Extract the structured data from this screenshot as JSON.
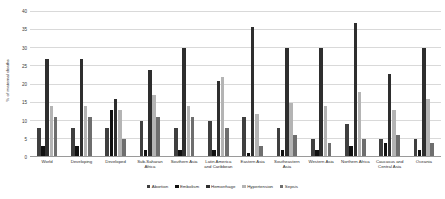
{
  "chart_data": {
    "type": "bar",
    "title": "",
    "xlabel": "",
    "ylabel": "% of maternal deaths",
    "ylim": [
      0,
      40
    ],
    "yticks": [
      0,
      5,
      10,
      15,
      20,
      25,
      30,
      35,
      40
    ],
    "grid": true,
    "legend_position": "bottom",
    "categories": [
      "World",
      "Developing",
      "Developed",
      "Sub-Saharan Africa",
      "Southern Asia",
      "Latin America and Caribbean",
      "Eastern Asia",
      "Southeastern Asia",
      "Western Asia",
      "Northern Africa",
      "Caucasus and Central Asia",
      "Oceania"
    ],
    "series": [
      {
        "name": "Abortion",
        "color": "#3f3f3f",
        "values": [
          8,
          8,
          8,
          10,
          8,
          10,
          11,
          8,
          5,
          9,
          5,
          5
        ]
      },
      {
        "name": "Embolism",
        "color": "#101010",
        "values": [
          3,
          3,
          13,
          2,
          2,
          2,
          1,
          2,
          2,
          3,
          4,
          2
        ]
      },
      {
        "name": "Hemorrhage",
        "color": "#2e2e2e",
        "values": [
          27,
          27,
          16,
          24,
          30,
          21,
          36,
          30,
          30,
          37,
          23,
          30
        ]
      },
      {
        "name": "Hypertension",
        "color": "#b4b4b4",
        "values": [
          14,
          14,
          13,
          17,
          14,
          22,
          12,
          15,
          14,
          18,
          13,
          16
        ]
      },
      {
        "name": "Sepsis",
        "color": "#6e6e6e",
        "values": [
          11,
          11,
          5,
          11,
          11,
          8,
          3,
          6,
          4,
          5,
          6,
          4
        ]
      }
    ]
  }
}
